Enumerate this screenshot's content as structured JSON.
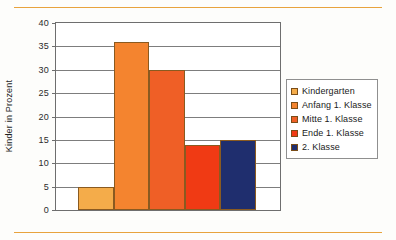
{
  "chart_data": {
    "type": "bar",
    "title": "",
    "xlabel": "",
    "ylabel": "Kinder in Prozent",
    "ylim": [
      0,
      40
    ],
    "ytick_step": 5,
    "yticks": [
      "40",
      "35",
      "30",
      "25",
      "20",
      "15",
      "10",
      "5",
      "0"
    ],
    "grid": true,
    "legend_position": "right",
    "categories": [
      "Kindergarten",
      "Anfang 1. Klasse",
      "Mitte 1. Klasse",
      "Ende 1. Klasse",
      "2. Klasse"
    ],
    "values": [
      5,
      36,
      30,
      14,
      15
    ],
    "colors": [
      "#f4ac4a",
      "#f4842f",
      "#ef5f26",
      "#f03a14",
      "#1f2e6e"
    ],
    "bar_border_color": "#8a5a20",
    "series": [
      {
        "name": "Kinder in Prozent",
        "values": [
          5,
          36,
          30,
          14,
          15
        ]
      }
    ]
  },
  "legend": {
    "items": [
      {
        "label": "Kindergarten",
        "color": "#f4ac4a"
      },
      {
        "label": "Anfang 1. Klasse",
        "color": "#f4842f"
      },
      {
        "label": "Mitte 1. Klasse",
        "color": "#ef5f26"
      },
      {
        "label": "Ende 1. Klasse",
        "color": "#f03a14"
      },
      {
        "label": "2. Klasse",
        "color": "#1f2e6e"
      }
    ]
  },
  "decoration": {
    "rule_color": "#e8a33d"
  }
}
